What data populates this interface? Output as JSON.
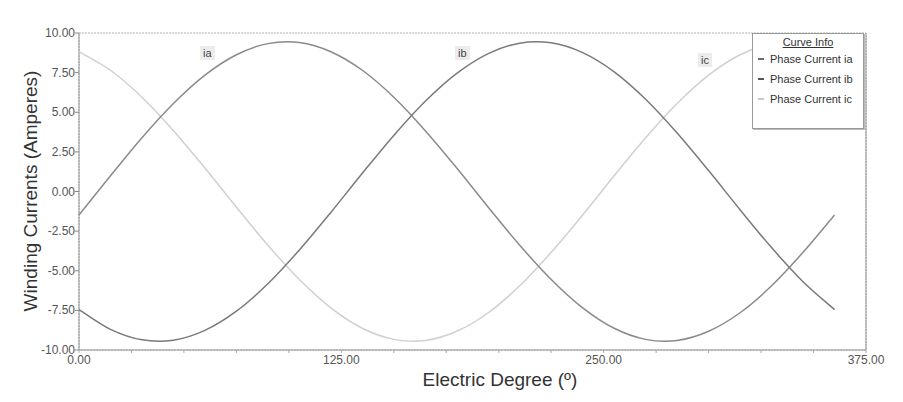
{
  "chart_data": {
    "type": "line",
    "title": "",
    "xlabel": "Electric Degree (º)",
    "ylabel": "Winding Currents (Amperes)",
    "xlim": [
      0,
      375
    ],
    "ylim": [
      -10,
      10
    ],
    "xticks": [
      "0.00",
      "125.00",
      "250.00",
      "375.00"
    ],
    "yticks": [
      "10.00",
      "7.50",
      "5.00",
      "2.50",
      "0.00",
      "-2.50",
      "-5.00",
      "-7.50",
      "-10.00"
    ],
    "grid": false,
    "legend_title": "Curve Info",
    "legend_position": "upper right",
    "x": [
      0,
      15,
      30,
      45,
      60,
      75,
      90,
      105,
      120,
      135,
      150,
      165,
      180,
      195,
      210,
      225,
      240,
      255,
      270,
      285,
      300,
      315,
      330,
      345,
      360
    ],
    "series": [
      {
        "name": "Phase Current ia",
        "tag": "ia",
        "color": "#8a8a8a",
        "values": [
          -1.48,
          0.99,
          3.39,
          5.55,
          7.34,
          8.63,
          9.33,
          9.4,
          8.82,
          7.65,
          5.95,
          3.84,
          1.48,
          -0.99,
          -3.39,
          -5.55,
          -7.34,
          -8.63,
          -9.33,
          -9.4,
          -8.82,
          -7.65,
          -5.95,
          -3.84,
          -1.48
        ]
      },
      {
        "name": "Phase Current ib",
        "tag": "ib",
        "color": "#7a7a7a",
        "values": [
          -7.45,
          -8.7,
          -9.36,
          -9.38,
          -8.76,
          -7.55,
          -5.82,
          -3.69,
          -1.32,
          1.15,
          3.54,
          5.69,
          7.45,
          8.7,
          9.36,
          9.38,
          8.76,
          7.55,
          5.82,
          3.69,
          1.32,
          -1.15,
          -3.54,
          -5.69,
          -7.45
        ]
      },
      {
        "name": "Phase Current ic",
        "tag": "ic",
        "color": "#d0d0d0",
        "values": [
          8.82,
          7.65,
          5.95,
          3.84,
          1.48,
          -0.99,
          -3.39,
          -5.55,
          -7.34,
          -8.63,
          -9.33,
          -9.4,
          -8.82,
          -7.65,
          -5.95,
          -3.84,
          -1.48,
          0.99,
          3.39,
          5.55,
          7.34,
          8.63,
          9.33,
          9.4,
          8.82
        ]
      }
    ],
    "annotations": [
      {
        "text": "ia",
        "x": 200,
        "y": 46
      },
      {
        "text": "ib",
        "x": 455,
        "y": 46
      },
      {
        "text": "ic",
        "x": 698,
        "y": 53
      }
    ]
  }
}
